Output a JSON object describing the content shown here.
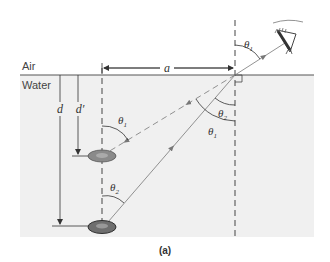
{
  "diagram": {
    "caption": "(a)",
    "media": {
      "upper": "Air",
      "lower": "Water"
    },
    "labels": {
      "horizontal_distance": "a",
      "true_depth": "d",
      "apparent_depth": "d′",
      "theta1": "θ",
      "theta1_sub": "1",
      "theta2": "θ",
      "theta2_sub": "2"
    },
    "elements": {
      "observer": "eye",
      "real_object": "coin (actual position)",
      "image_object": "coin (apparent position)"
    },
    "colors": {
      "water_fill": "#f0f0f0",
      "line": "#555555",
      "ray": "#777777",
      "coin": "#8a8a8a",
      "coin_edge": "#3a3a3a"
    }
  }
}
